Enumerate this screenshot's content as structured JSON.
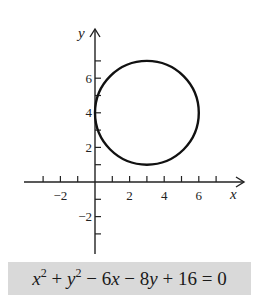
{
  "chart_data": {
    "type": "line",
    "title": "",
    "xlabel": "x",
    "ylabel": "y",
    "xlim": [
      -3.5,
      7.5
    ],
    "ylim": [
      -4,
      7.7
    ],
    "x_ticks": [
      -3,
      -2,
      -1,
      0,
      1,
      2,
      3,
      4,
      5,
      6,
      7
    ],
    "x_tick_labels": [
      "-2",
      "2",
      "4",
      "6"
    ],
    "x_tick_label_values": [
      -2,
      2,
      4,
      6
    ],
    "y_ticks": [
      -3,
      -2,
      -1,
      1,
      2,
      3,
      4,
      5,
      6,
      7
    ],
    "y_tick_labels": [
      "-2",
      "2",
      "4",
      "6"
    ],
    "y_tick_label_values": [
      -2,
      2,
      4,
      6
    ],
    "grid": false,
    "series": [
      {
        "name": "circle",
        "shape": "circle",
        "center": [
          3,
          4
        ],
        "radius": 3
      }
    ],
    "equation": "x^2 + y^2 - 6x - 8y + 16 = 0"
  },
  "axes": {
    "x_label": "x",
    "y_label": "y"
  },
  "equation": {
    "x": "x",
    "x_exp": "2",
    "plus1": " + ",
    "y": "y",
    "y_exp": "2",
    "minus1": " − 6",
    "x2": "x",
    "minus2": " − 8",
    "y2": "y",
    "rest": " + 16 = 0"
  },
  "colors": {
    "curve": "#111111",
    "axis": "#222222",
    "equation_bg": "#d9d9d9"
  }
}
